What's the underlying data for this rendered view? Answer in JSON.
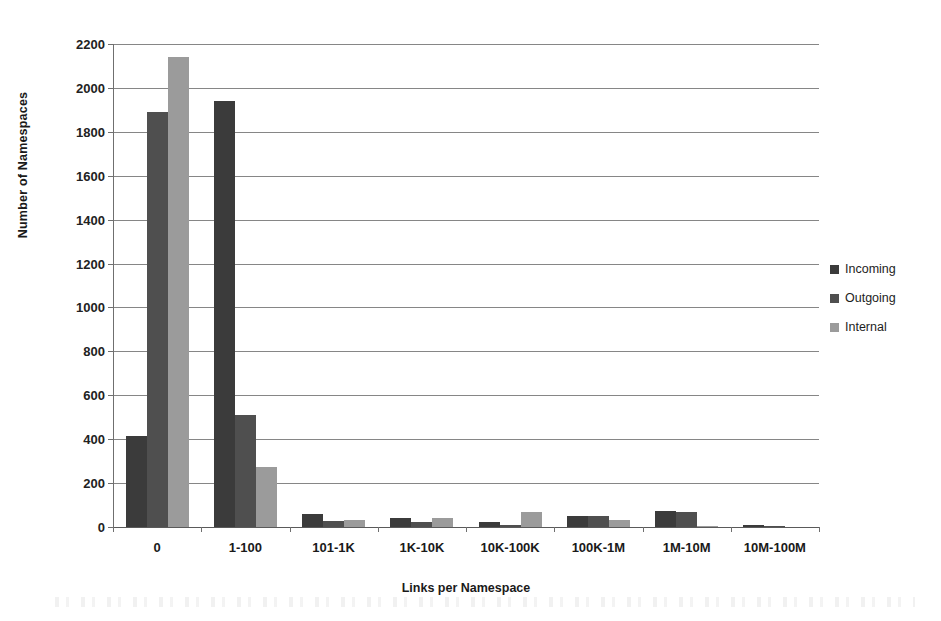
{
  "chart_data": {
    "type": "bar",
    "title": "",
    "xlabel": "Links per Namespace",
    "ylabel": "Number of Namespaces",
    "categories": [
      "0",
      "1-100",
      "101-1K",
      "1K-10K",
      "10K-100K",
      "100K-1M",
      "1M-10M",
      "10M-100M"
    ],
    "series": [
      {
        "name": "Incoming",
        "color": "#3b3b3b",
        "values": [
          415,
          1940,
          60,
          40,
          25,
          48,
          72,
          10
        ]
      },
      {
        "name": "Outgoing",
        "color": "#4f4f4f",
        "values": [
          1890,
          510,
          28,
          22,
          8,
          48,
          68,
          3
        ]
      },
      {
        "name": "Internal",
        "color": "#9b9b9b",
        "values": [
          2140,
          275,
          30,
          40,
          68,
          33,
          5,
          0
        ]
      }
    ],
    "ylim": [
      0,
      2200
    ],
    "ytick_labels": [
      "0",
      "200",
      "400",
      "600",
      "800",
      "1000",
      "1200",
      "1400",
      "1600",
      "1800",
      "2000",
      "2200"
    ],
    "ytick_values": [
      0,
      200,
      400,
      600,
      800,
      1000,
      1200,
      1400,
      1600,
      1800,
      2000,
      2200
    ],
    "grid": true,
    "legend_position": "right"
  },
  "legend": {
    "items": [
      {
        "label": "Incoming",
        "color": "#3b3b3b"
      },
      {
        "label": "Outgoing",
        "color": "#4f4f4f"
      },
      {
        "label": "Internal",
        "color": "#9b9b9b"
      }
    ]
  }
}
